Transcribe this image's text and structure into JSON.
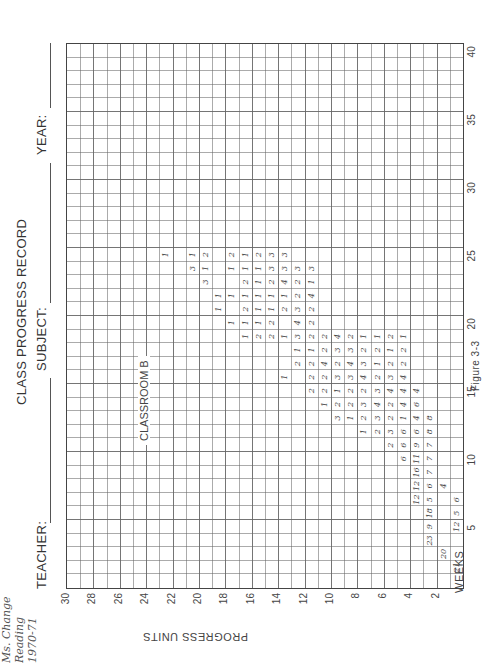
{
  "header": {
    "title": "CLASS PROGRESS RECORD",
    "teacher_label": "TEACHER:",
    "teacher_value": "Ms. Change",
    "subject_label": "SUBJECT:",
    "subject_value": "Reading",
    "year_label": "YEAR:",
    "year_value": "1970-71"
  },
  "annotation": "CLASSROOM B",
  "figure_caption": "Figure 3-3",
  "chart_data": {
    "type": "table",
    "title": "CLASS PROGRESS RECORD",
    "subtitle": "CLASSROOM B",
    "xlabel": "WEEKS",
    "ylabel": "PROGRESS UNITS",
    "xlim": [
      0,
      40
    ],
    "ylim": [
      0,
      30
    ],
    "x_ticks": [
      5,
      10,
      15,
      20,
      25,
      30,
      35,
      40
    ],
    "y_ticks": [
      2,
      4,
      6,
      8,
      10,
      12,
      14,
      16,
      18,
      20,
      22,
      24,
      26,
      28,
      30
    ],
    "grid": true,
    "orientation": "rotated 90 degrees counterclockwise on page",
    "cells": [
      {
        "week": 2,
        "unit": 1,
        "count": 21
      },
      {
        "week": 3,
        "unit": 2,
        "count": 20
      },
      {
        "week": 4,
        "unit": 3,
        "count": 23
      },
      {
        "week": 5,
        "unit": 1,
        "count": 12
      },
      {
        "week": 5,
        "unit": 3,
        "count": 9
      },
      {
        "week": 6,
        "unit": 1,
        "count": 5
      },
      {
        "week": 6,
        "unit": 3,
        "count": 18
      },
      {
        "week": 7,
        "unit": 1,
        "count": 6
      },
      {
        "week": 7,
        "unit": 3,
        "count": 5
      },
      {
        "week": 7,
        "unit": 4,
        "count": 12
      },
      {
        "week": 8,
        "unit": 2,
        "count": 4
      },
      {
        "week": 8,
        "unit": 3,
        "count": 6
      },
      {
        "week": 8,
        "unit": 4,
        "count": 12
      },
      {
        "week": 9,
        "unit": 3,
        "count": 7
      },
      {
        "week": 9,
        "unit": 4,
        "count": 16
      },
      {
        "week": 10,
        "unit": 3,
        "count": 7
      },
      {
        "week": 10,
        "unit": 4,
        "count": 11
      },
      {
        "week": 10,
        "unit": 5,
        "count": 6
      },
      {
        "week": 11,
        "unit": 3,
        "count": 7
      },
      {
        "week": 11,
        "unit": 4,
        "count": 9
      },
      {
        "week": 11,
        "unit": 5,
        "count": 6
      },
      {
        "week": 11,
        "unit": 6,
        "count": 2
      },
      {
        "week": 12,
        "unit": 3,
        "count": 8
      },
      {
        "week": 12,
        "unit": 4,
        "count": 6
      },
      {
        "week": 12,
        "unit": 5,
        "count": 6
      },
      {
        "week": 12,
        "unit": 6,
        "count": 3
      },
      {
        "week": 12,
        "unit": 7,
        "count": 2
      },
      {
        "week": 12,
        "unit": 8,
        "count": 1
      },
      {
        "week": 13,
        "unit": 3,
        "count": 8
      },
      {
        "week": 13,
        "unit": 4,
        "count": 4
      },
      {
        "week": 13,
        "unit": 5,
        "count": 1
      },
      {
        "week": 13,
        "unit": 6,
        "count": 2
      },
      {
        "week": 13,
        "unit": 7,
        "count": 3
      },
      {
        "week": 13,
        "unit": 8,
        "count": 2
      },
      {
        "week": 13,
        "unit": 9,
        "count": 1
      },
      {
        "week": 13,
        "unit": 10,
        "count": 3
      },
      {
        "week": 14,
        "unit": 4,
        "count": 6
      },
      {
        "week": 14,
        "unit": 5,
        "count": 4
      },
      {
        "week": 14,
        "unit": 6,
        "count": 2
      },
      {
        "week": 14,
        "unit": 7,
        "count": 4
      },
      {
        "week": 14,
        "unit": 8,
        "count": 3
      },
      {
        "week": 14,
        "unit": 9,
        "count": 2
      },
      {
        "week": 14,
        "unit": 10,
        "count": 2
      },
      {
        "week": 14,
        "unit": 11,
        "count": 1
      },
      {
        "week": 15,
        "unit": 4,
        "count": 4
      },
      {
        "week": 15,
        "unit": 5,
        "count": 4
      },
      {
        "week": 15,
        "unit": 6,
        "count": 4
      },
      {
        "week": 15,
        "unit": 7,
        "count": 3
      },
      {
        "week": 15,
        "unit": 8,
        "count": 2
      },
      {
        "week": 15,
        "unit": 9,
        "count": 2
      },
      {
        "week": 15,
        "unit": 10,
        "count": 1
      },
      {
        "week": 15,
        "unit": 11,
        "count": 2
      },
      {
        "week": 15,
        "unit": 12,
        "count": 2
      },
      {
        "week": 16,
        "unit": 5,
        "count": 4
      },
      {
        "week": 16,
        "unit": 6,
        "count": 3
      },
      {
        "week": 16,
        "unit": 7,
        "count": 2
      },
      {
        "week": 16,
        "unit": 8,
        "count": 4
      },
      {
        "week": 16,
        "unit": 9,
        "count": 3
      },
      {
        "week": 16,
        "unit": 10,
        "count": 3
      },
      {
        "week": 16,
        "unit": 11,
        "count": 2
      },
      {
        "week": 16,
        "unit": 12,
        "count": 2
      },
      {
        "week": 16,
        "unit": 14,
        "count": 1
      },
      {
        "week": 17,
        "unit": 5,
        "count": 2
      },
      {
        "week": 17,
        "unit": 6,
        "count": 2
      },
      {
        "week": 17,
        "unit": 7,
        "count": 1
      },
      {
        "week": 17,
        "unit": 8,
        "count": 3
      },
      {
        "week": 17,
        "unit": 9,
        "count": 4
      },
      {
        "week": 17,
        "unit": 10,
        "count": 2
      },
      {
        "week": 17,
        "unit": 11,
        "count": 4
      },
      {
        "week": 17,
        "unit": 12,
        "count": 2
      },
      {
        "week": 17,
        "unit": 13,
        "count": 2
      },
      {
        "week": 18,
        "unit": 5,
        "count": 2
      },
      {
        "week": 18,
        "unit": 6,
        "count": 1
      },
      {
        "week": 18,
        "unit": 7,
        "count": 2
      },
      {
        "week": 18,
        "unit": 8,
        "count": 2
      },
      {
        "week": 18,
        "unit": 9,
        "count": 3
      },
      {
        "week": 18,
        "unit": 10,
        "count": 3
      },
      {
        "week": 18,
        "unit": 11,
        "count": 2
      },
      {
        "week": 18,
        "unit": 12,
        "count": 1
      },
      {
        "week": 18,
        "unit": 13,
        "count": 1
      },
      {
        "week": 19,
        "unit": 5,
        "count": 1
      },
      {
        "week": 19,
        "unit": 6,
        "count": 2
      },
      {
        "week": 19,
        "unit": 7,
        "count": 1
      },
      {
        "week": 19,
        "unit": 8,
        "count": 1
      },
      {
        "week": 19,
        "unit": 9,
        "count": 2
      },
      {
        "week": 19,
        "unit": 10,
        "count": 4
      },
      {
        "week": 19,
        "unit": 11,
        "count": 2
      },
      {
        "week": 19,
        "unit": 12,
        "count": 2
      },
      {
        "week": 19,
        "unit": 13,
        "count": 3
      },
      {
        "week": 19,
        "unit": 14,
        "count": 1
      },
      {
        "week": 19,
        "unit": 15,
        "count": 2
      },
      {
        "week": 19,
        "unit": 16,
        "count": 2
      },
      {
        "week": 19,
        "unit": 17,
        "count": 1
      },
      {
        "week": 20,
        "unit": 12,
        "count": 2
      },
      {
        "week": 20,
        "unit": 13,
        "count": 4
      },
      {
        "week": 20,
        "unit": 15,
        "count": 2
      },
      {
        "week": 20,
        "unit": 16,
        "count": 1
      },
      {
        "week": 20,
        "unit": 17,
        "count": 1
      },
      {
        "week": 20,
        "unit": 18,
        "count": 1
      },
      {
        "week": 21,
        "unit": 12,
        "count": 2
      },
      {
        "week": 21,
        "unit": 13,
        "count": 3
      },
      {
        "week": 21,
        "unit": 14,
        "count": 2
      },
      {
        "week": 21,
        "unit": 15,
        "count": 1
      },
      {
        "week": 21,
        "unit": 16,
        "count": 1
      },
      {
        "week": 21,
        "unit": 17,
        "count": 2
      },
      {
        "week": 21,
        "unit": 19,
        "count": 1
      },
      {
        "week": 22,
        "unit": 12,
        "count": 4
      },
      {
        "week": 22,
        "unit": 13,
        "count": 2
      },
      {
        "week": 22,
        "unit": 14,
        "count": 1
      },
      {
        "week": 22,
        "unit": 15,
        "count": 1
      },
      {
        "week": 22,
        "unit": 16,
        "count": 1
      },
      {
        "week": 22,
        "unit": 17,
        "count": 1
      },
      {
        "week": 22,
        "unit": 18,
        "count": 1
      },
      {
        "week": 22,
        "unit": 19,
        "count": 1
      },
      {
        "week": 23,
        "unit": 12,
        "count": 1
      },
      {
        "week": 23,
        "unit": 13,
        "count": 2
      },
      {
        "week": 23,
        "unit": 14,
        "count": 4
      },
      {
        "week": 23,
        "unit": 15,
        "count": 2
      },
      {
        "week": 23,
        "unit": 16,
        "count": 1
      },
      {
        "week": 23,
        "unit": 17,
        "count": 2
      },
      {
        "week": 23,
        "unit": 20,
        "count": 3
      },
      {
        "week": 24,
        "unit": 12,
        "count": 3
      },
      {
        "week": 24,
        "unit": 13,
        "count": 3
      },
      {
        "week": 24,
        "unit": 14,
        "count": 3
      },
      {
        "week": 24,
        "unit": 15,
        "count": 3
      },
      {
        "week": 24,
        "unit": 16,
        "count": 1
      },
      {
        "week": 24,
        "unit": 17,
        "count": 1
      },
      {
        "week": 24,
        "unit": 18,
        "count": 1
      },
      {
        "week": 24,
        "unit": 20,
        "count": 1
      },
      {
        "week": 24,
        "unit": 21,
        "count": 3
      },
      {
        "week": 25,
        "unit": 14,
        "count": 3
      },
      {
        "week": 25,
        "unit": 15,
        "count": 3
      },
      {
        "week": 25,
        "unit": 16,
        "count": 2
      },
      {
        "week": 25,
        "unit": 17,
        "count": 1
      },
      {
        "week": 25,
        "unit": 18,
        "count": 2
      },
      {
        "week": 25,
        "unit": 20,
        "count": 2
      },
      {
        "week": 25,
        "unit": 21,
        "count": 1
      },
      {
        "week": 25,
        "unit": 23,
        "count": 1
      }
    ]
  }
}
